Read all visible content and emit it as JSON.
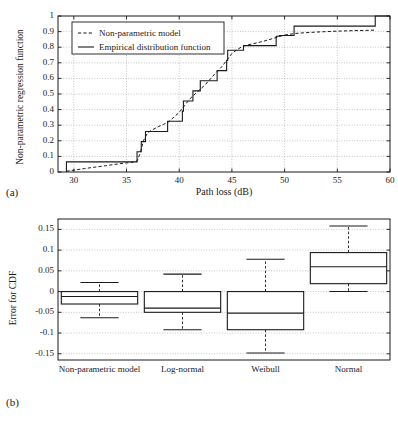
{
  "figure": {
    "panel_a_label": "(a)",
    "panel_b_label": "(b)"
  },
  "chart_data": [
    {
      "type": "line",
      "panel": "(a)",
      "title": "",
      "xlabel": "Path loss (dB)",
      "ylabel": "Non-parametric regression function",
      "xlim": [
        28.5,
        60
      ],
      "ylim": [
        0,
        1
      ],
      "xticks": [
        30,
        35,
        40,
        45,
        50,
        55,
        60
      ],
      "xtick_labels": [
        "30",
        "35",
        "40",
        "45",
        "50",
        "55",
        "60"
      ],
      "yticks": [
        0,
        0.1,
        0.2,
        0.3,
        0.4,
        0.5,
        0.6,
        0.7,
        0.8,
        0.9,
        1
      ],
      "ytick_labels": [
        "0",
        "0.1",
        "0.2",
        "0.3",
        "0.4",
        "0.5",
        "0.6",
        "0.7",
        "0.8",
        "0.9",
        "1"
      ],
      "grid": true,
      "legend_position": "upper-left",
      "series": [
        {
          "name": "Non-parametric model",
          "style": "dashed",
          "color": "#1a1a1a",
          "x": [
            29.3,
            30.0,
            31.0,
            32.0,
            33.0,
            34.0,
            35.0,
            35.6,
            36.0,
            36.3,
            36.6,
            37.0,
            37.5,
            38.0,
            38.5,
            39.0,
            39.5,
            40.0,
            40.5,
            41.0,
            41.5,
            42.0,
            42.5,
            43.0,
            43.5,
            44.0,
            44.5,
            45.0,
            45.5,
            46.0,
            46.5,
            47.0,
            48.0,
            49.0,
            49.5,
            50.0,
            51.0,
            52.0,
            53.0,
            54.0,
            55.0,
            56.0,
            57.0,
            58.0,
            58.7
          ],
          "y": [
            0.005,
            0.012,
            0.022,
            0.031,
            0.04,
            0.05,
            0.058,
            0.063,
            0.07,
            0.12,
            0.2,
            0.252,
            0.272,
            0.29,
            0.305,
            0.322,
            0.352,
            0.382,
            0.425,
            0.468,
            0.5,
            0.53,
            0.562,
            0.6,
            0.638,
            0.672,
            0.715,
            0.76,
            0.785,
            0.805,
            0.815,
            0.822,
            0.838,
            0.858,
            0.868,
            0.878,
            0.888,
            0.893,
            0.897,
            0.9,
            0.903,
            0.905,
            0.907,
            0.908,
            0.91
          ]
        },
        {
          "name": "Empirical distribution function",
          "style": "solid-step",
          "color": "#1a1a1a",
          "x": [
            29.3,
            29.3,
            36.0,
            36.0,
            36.4,
            36.4,
            36.8,
            36.8,
            38.9,
            38.9,
            40.3,
            40.3,
            40.4,
            40.4,
            41.3,
            41.3,
            42.0,
            42.0,
            42.6,
            42.6,
            43.6,
            43.6,
            44.5,
            44.5,
            44.6,
            44.6,
            45.0,
            45.0,
            46.1,
            46.1,
            49.2,
            49.2,
            49.5,
            49.5,
            50.9,
            50.9,
            58.6,
            58.6,
            60.0
          ],
          "y": [
            0.0,
            0.065,
            0.065,
            0.13,
            0.13,
            0.195,
            0.195,
            0.26,
            0.26,
            0.325,
            0.325,
            0.39,
            0.39,
            0.455,
            0.455,
            0.52,
            0.52,
            0.585,
            0.585,
            0.585,
            0.585,
            0.65,
            0.65,
            0.715,
            0.715,
            0.78,
            0.78,
            0.78,
            0.78,
            0.81,
            0.81,
            0.87,
            0.87,
            0.875,
            0.875,
            0.935,
            0.935,
            1.0,
            1.0
          ]
        }
      ],
      "legend": [
        {
          "label": "Non-parametric model",
          "style": "dashed"
        },
        {
          "label": "Empirical distribution function",
          "style": "solid"
        }
      ]
    },
    {
      "type": "boxplot",
      "panel": "(b)",
      "title": "",
      "xlabel": "",
      "ylabel": "Error for CDF",
      "ylim": [
        -0.165,
        0.175
      ],
      "yticks": [
        0.15,
        0.1,
        0.05,
        0,
        -0.05,
        -0.1,
        -0.15
      ],
      "ytick_labels": [
        "0.15",
        "0.1",
        "0.05",
        "0",
        "-0.05",
        "-0.1",
        "-0.15"
      ],
      "grid": true,
      "categories": [
        "Non-parametric model",
        "Log-normal",
        "Weibull",
        "Normal"
      ],
      "boxes": [
        {
          "name": "Non-parametric model",
          "whisker_low": -0.063,
          "q1": -0.03,
          "median": -0.012,
          "q3": 0.0,
          "whisker_high": 0.022
        },
        {
          "name": "Log-normal",
          "whisker_low": -0.092,
          "q1": -0.05,
          "median": -0.04,
          "q3": 0.0,
          "whisker_high": 0.042
        },
        {
          "name": "Weibull",
          "whisker_low": -0.148,
          "q1": -0.092,
          "median": -0.052,
          "q3": 0.0,
          "whisker_high": 0.078
        },
        {
          "name": "Normal",
          "whisker_low": 0.0,
          "q1": 0.019,
          "median": 0.06,
          "q3": 0.094,
          "whisker_high": 0.158
        }
      ]
    }
  ]
}
